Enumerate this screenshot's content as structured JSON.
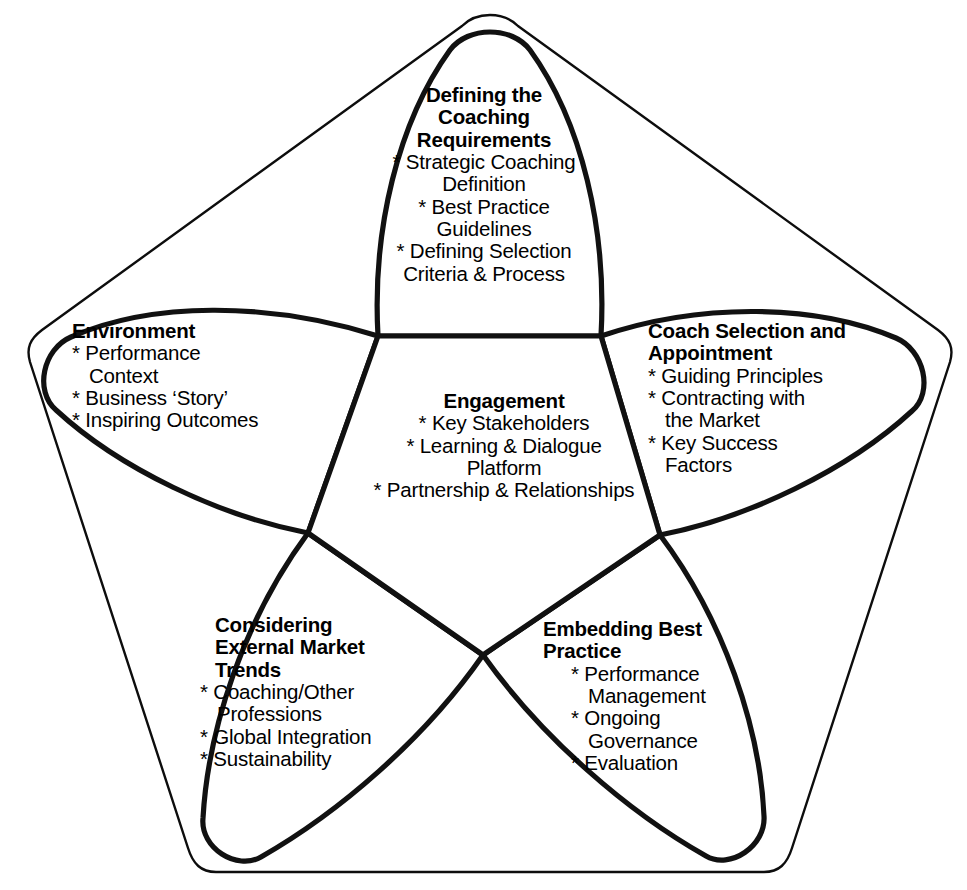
{
  "diagram": {
    "type": "pentagon-petal-framework",
    "shape_description": "Five-petal flower inside a rounded pentagon outline with a central pentagon hub",
    "colors": {
      "background": "#ffffff",
      "stroke": "#111111",
      "outer_outline": "#0d0d0d",
      "text": "#000000"
    },
    "center": {
      "heading": "Engagement",
      "items": [
        "* Key Stakeholders",
        "* Learning & Dialogue",
        "Platform",
        "* Partnership & Relationships"
      ]
    },
    "petals": [
      {
        "id": "defining-the-coaching-requirements",
        "position": "top",
        "heading_lines": [
          "Defining the",
          "Coaching",
          "Requirements"
        ],
        "items": [
          "* Strategic Coaching",
          "Definition",
          "* Best Practice",
          "Guidelines",
          "* Defining Selection",
          "Criteria & Process"
        ]
      },
      {
        "id": "coach-selection-and-appointment",
        "position": "right",
        "heading_lines": [
          "Coach Selection and",
          "Appointment"
        ],
        "items": [
          "* Guiding Principles",
          "* Contracting with",
          "the Market",
          "* Key Success",
          "Factors"
        ]
      },
      {
        "id": "embedding-best-practice",
        "position": "bottom-right",
        "heading_lines": [
          "Embedding Best",
          "Practice"
        ],
        "items": [
          "* Performance",
          "Management",
          "* Ongoing",
          "Governance",
          "* Evaluation"
        ]
      },
      {
        "id": "considering-external-market-trends",
        "position": "bottom-left",
        "heading_lines": [
          "Considering",
          "External Market",
          "Trends"
        ],
        "items": [
          "* Coaching/Other",
          "Professions",
          "* Global Integration",
          "* Sustainability"
        ]
      },
      {
        "id": "environment",
        "position": "left",
        "heading_lines": [
          "Environment"
        ],
        "items": [
          "* Performance",
          "Context",
          "* Business ‘Story’",
          "* Inspiring Outcomes"
        ]
      }
    ]
  }
}
